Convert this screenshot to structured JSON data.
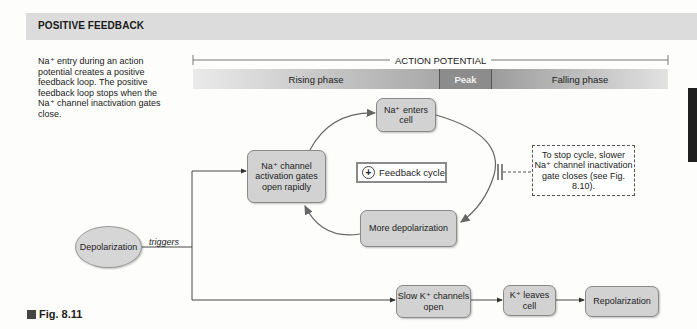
{
  "header": {
    "title": "POSITIVE FEEDBACK"
  },
  "intro": {
    "text": "Na⁺ entry during an action potential creates a positive feedback loop.  The positive feedback loop stops when the Na⁺ channel inactivation gates close."
  },
  "timeline": {
    "label": "ACTION POTENTIAL",
    "phases": [
      {
        "label": "Rising phase"
      },
      {
        "label": "Peak"
      },
      {
        "label": "Falling phase"
      }
    ]
  },
  "nodes": {
    "depolarization": "Depolarization",
    "na_channel": "Na⁺ channel activation gates open rapidly",
    "na_enters": "Na⁺ enters cell",
    "more_depol": "More depolarization",
    "slow_k": "Slow K⁺ channels open",
    "k_leaves": "K⁺ leaves cell",
    "repolarization": "Repolarization"
  },
  "feedback": {
    "icon": "plus-circle-icon",
    "symbol": "+",
    "label": "Feedback cycle"
  },
  "stop_note": "To stop cycle, slower Na⁺ channel inactivation gate closes (see Fig. 8.10).",
  "edge_label": "triggers",
  "figure": {
    "label": "Fig. 8.11"
  }
}
